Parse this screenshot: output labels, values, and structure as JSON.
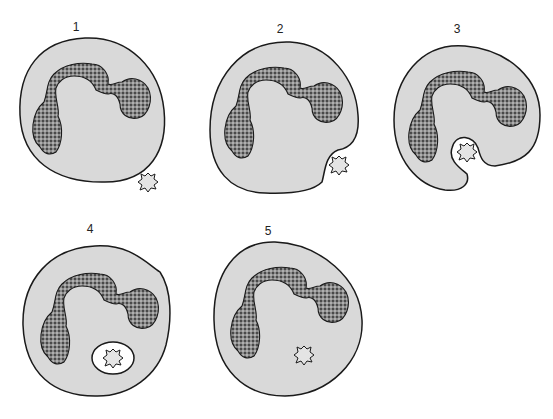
{
  "figure": {
    "colors": {
      "cytoplasm": "#d9d9d9",
      "outline": "#1a1a1a",
      "nucleus": "#555555",
      "background": "#ffffff"
    },
    "panels": [
      {
        "label": "1",
        "stage": "particle approaches cell"
      },
      {
        "label": "2",
        "stage": "particle contacts membrane"
      },
      {
        "label": "3",
        "stage": "membrane engulfs particle"
      },
      {
        "label": "4",
        "stage": "particle enclosed in phagosome"
      },
      {
        "label": "5",
        "stage": "particle digested in cytoplasm"
      }
    ]
  }
}
